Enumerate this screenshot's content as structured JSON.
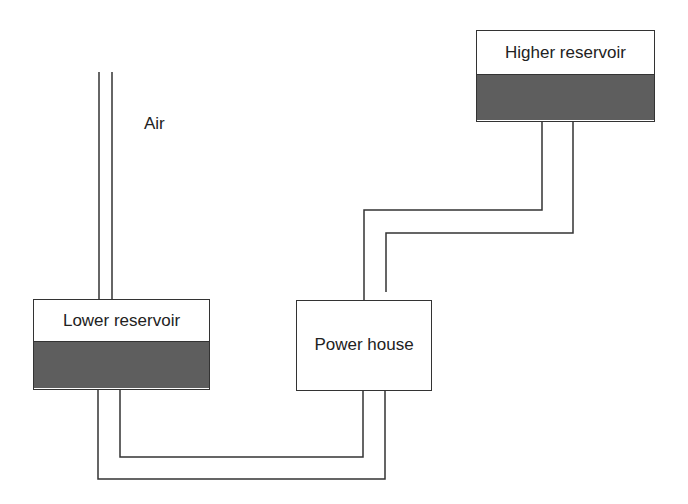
{
  "diagram": {
    "title": "",
    "colors": {
      "line": "#333333",
      "water": "#5e5e5e",
      "background": "#ffffff"
    },
    "nodes": {
      "higher_reservoir": {
        "label": "Higher reservoir"
      },
      "lower_reservoir": {
        "label": "Lower reservoir"
      },
      "power_house": {
        "label": "Power house"
      }
    },
    "labels": {
      "air": "Air"
    },
    "connections": [
      {
        "from": "higher_reservoir",
        "to": "power_house",
        "type": "double-pipe"
      },
      {
        "from": "lower_reservoir",
        "to": "power_house",
        "type": "double-pipe"
      },
      {
        "from": "lower_reservoir",
        "to": "air",
        "type": "double-pipe (air shaft)"
      }
    ]
  }
}
